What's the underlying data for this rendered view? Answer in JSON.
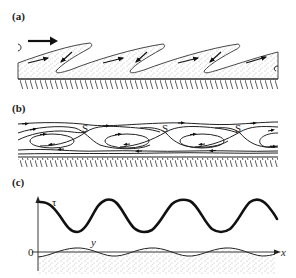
{
  "figure": {
    "panels": [
      {
        "id": "a",
        "label": "(a)",
        "description": "Sand ripples with recirculating flow in troughs; large arrow indicates flow direction to the right",
        "flow_arrow": "right"
      },
      {
        "id": "b",
        "label": "(b)",
        "description": "Streamlines above ripple bed with closed recirculation eddies and saddle points",
        "saddle_label": "S",
        "saddle_count": 3,
        "eddy_count": 4
      },
      {
        "id": "c",
        "label": "(c)",
        "description": "Bed shear stress tau versus x above sinusoidal bed profile y",
        "tau_label": "τ",
        "y_label": "y",
        "x_label": "x",
        "origin_label": "0"
      }
    ],
    "colors": {
      "ink": "#222222",
      "background": "#ffffff",
      "sand_dots": "#555555"
    }
  }
}
